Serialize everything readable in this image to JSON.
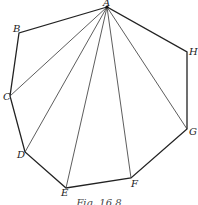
{
  "figure": {
    "caption": "Fig. 16.8",
    "stroke_color": "#222222",
    "vertices": [
      {
        "name": "A",
        "x": 107,
        "y": 7
      },
      {
        "name": "B",
        "x": 19,
        "y": 33
      },
      {
        "name": "C",
        "x": 10,
        "y": 96
      },
      {
        "name": "D",
        "x": 25,
        "y": 152
      },
      {
        "name": "E",
        "x": 66,
        "y": 188
      },
      {
        "name": "F",
        "x": 131,
        "y": 178
      },
      {
        "name": "G",
        "x": 187,
        "y": 129
      },
      {
        "name": "H",
        "x": 187,
        "y": 52
      }
    ],
    "polygon": [
      "A",
      "B",
      "C",
      "D",
      "E",
      "F",
      "G",
      "H"
    ],
    "diagonals_from_A": [
      "C",
      "D",
      "E",
      "F",
      "G"
    ]
  },
  "labels": {
    "A": "A",
    "B": "B",
    "C": "C",
    "D": "D",
    "E": "E",
    "F": "F",
    "G": "G",
    "H": "H"
  }
}
